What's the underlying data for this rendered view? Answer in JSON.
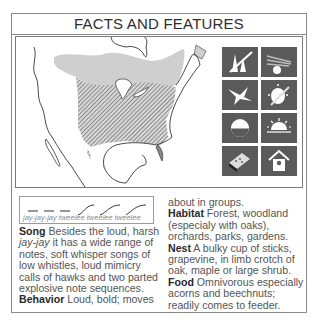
{
  "header": {
    "title": "FACTS AND FEATURES"
  },
  "map": {
    "legend": {
      "range_summer": "light gray",
      "range_year_round": "hatched"
    }
  },
  "icons": [
    {
      "name": "forest-habitat-icon"
    },
    {
      "name": "woodland-sun-icon"
    },
    {
      "name": "bird-flight-icon"
    },
    {
      "name": "egg-nest-icon"
    },
    {
      "name": "half-moon-icon"
    },
    {
      "name": "sunrise-icon"
    },
    {
      "name": "feeder-icon"
    },
    {
      "name": "birdhouse-icon"
    }
  ],
  "song_diagram": {
    "caption_prefix": "jay-jay-jay",
    "caption_suffix": " tweelee tweelee tweelee"
  },
  "text": {
    "song_label": "Song",
    "song_1": " Besides the loud, harsh ",
    "song_italic": "jay-jay",
    "song_2": " it has a wide range of notes, soft whisper songs of low whistles, loud mimicry calls of hawks and two parted explosive note sequences.",
    "behavior_label": "Behavior",
    "behavior_1": " Loud, bold; moves",
    "behavior_2": "about in groups.",
    "habitat_label": "Habitat",
    "habitat": " Forest, woodland (especialy with oaks), orchards, parks, gardens.",
    "nest_label": "Nest",
    "nest": " A bulky cup of sticks, grapevine, in limb crotch of oak, maple or large shrub.",
    "food_label": "Food",
    "food": " Omnivorous especially acorns and beechnuts; readily comes to feeder."
  }
}
